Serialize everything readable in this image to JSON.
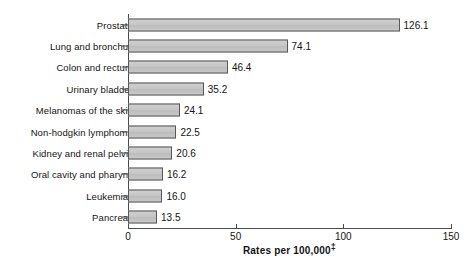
{
  "chart_data": {
    "type": "bar",
    "orientation": "horizontal",
    "title": "",
    "xlabel": "Rates per 100,000‡",
    "ylabel": "",
    "xlim": [
      0,
      150
    ],
    "xticks": [
      0,
      50,
      100,
      150
    ],
    "xtick_labels": [
      "0",
      "50",
      "100",
      "150"
    ],
    "grid": false,
    "legend": null,
    "categories": [
      "Prostate",
      "Lung and bronchus",
      "Colon and rectum",
      "Urinary bladder",
      "Melanomas of the skin",
      "Non-hodgkin lymphoma",
      "Kidney and renal pelvis",
      "Oral cavity and pharynx",
      "Leukemias",
      "Pancreas"
    ],
    "values": [
      126.1,
      74.1,
      46.4,
      35.2,
      24.1,
      22.5,
      20.6,
      16.2,
      16.0,
      13.5
    ],
    "value_labels": [
      "126.1",
      "74.1",
      "46.4",
      "35.2",
      "24.1",
      "22.5",
      "20.6",
      "16.2",
      "16.0",
      "13.5"
    ],
    "bar_fill": "#c6c6c6",
    "bar_border": "#585858",
    "axis_color": "#4a4a4a",
    "background": "#ffffff"
  },
  "axis": {
    "title_main": "Rates per 100,000",
    "title_footnote_marker": "‡"
  }
}
